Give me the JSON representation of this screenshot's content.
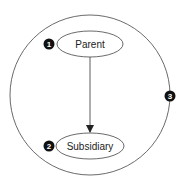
{
  "diagram": {
    "boundary": {
      "badge": "3"
    },
    "nodes": [
      {
        "id": "parent",
        "label": "Parent",
        "badge": "1"
      },
      {
        "id": "subsidiary",
        "label": "Subsidiary",
        "badge": "2"
      }
    ],
    "edges": [
      {
        "from": "parent",
        "to": "subsidiary",
        "style": "arrow"
      }
    ],
    "colors": {
      "stroke": "#333333",
      "badge_fill": "#111111",
      "text": "#222222"
    }
  }
}
